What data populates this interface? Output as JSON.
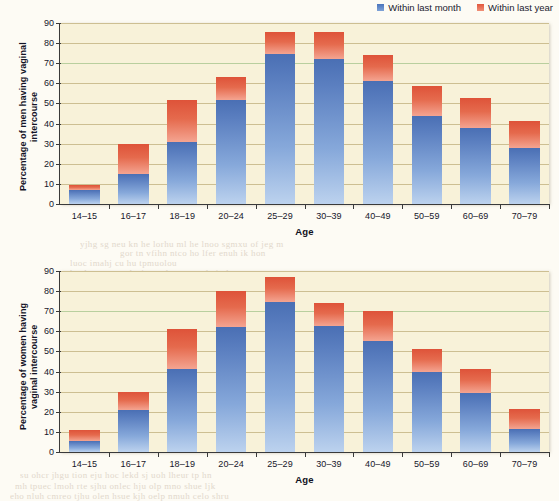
{
  "legend": {
    "items": [
      {
        "label": "Within last month",
        "color": "#4a74bc",
        "key": "within_last_month"
      },
      {
        "label": "Within last year",
        "color": "#e2573c",
        "key": "within_last_year"
      }
    ]
  },
  "bleed_text": [
    {
      "text": "yjhg sg neu kn  he lorhu  ml he lnoo sgmxu of jeg m",
      "x": 80,
      "y": 239,
      "rot": 0
    },
    {
      "text": "gor  tn  vfihn  ntco  ho lfer enuh  ik hon",
      "x": 120,
      "y": 248,
      "rot": 0
    },
    {
      "text": "luoc imahj cu hu tpmuolou",
      "x": 70,
      "y": 258,
      "rot": 0
    },
    {
      "text": "heulc rn  egtuo hs jeo  unlo emr eu hoin  huc",
      "x": 70,
      "y": 268,
      "rot": 0
    },
    {
      "text": "hu lnr  mon  me iol  hcu",
      "x": 165,
      "y": 330,
      "rot": 0
    },
    {
      "text": "su ohcr  jhgu tion  eju  hoc lekd  sj uoh  lheur tp  hn",
      "x": 20,
      "y": 470,
      "rot": 0
    },
    {
      "text": "mh  tpuec  lmoh  rte  sjhu  onlec  hju olp  mno shue  ljk",
      "x": 15,
      "y": 481,
      "rot": 0
    },
    {
      "text": "eho  nluh  cmreo  tjhu  olen  hsue  kjh  oelp  nmuh  celo  shru",
      "x": 10,
      "y": 491,
      "rot": 0
    }
  ],
  "chart_data": [
    {
      "type": "bar",
      "id": "men",
      "stacked": true,
      "title": "",
      "xlabel": "Age",
      "ylabel": "Percentage of men having vaginal intercourse",
      "ylim": [
        0,
        90
      ],
      "ytick_step": 10,
      "yticks": [
        0,
        10,
        20,
        30,
        40,
        50,
        60,
        70,
        80,
        90
      ],
      "grid": true,
      "legend_position": "top-right",
      "categories": [
        "14–15",
        "16–17",
        "18–19",
        "20–24",
        "25–29",
        "30–39",
        "40–49",
        "50–59",
        "60–69",
        "70–79"
      ],
      "series": [
        {
          "name": "Within last month",
          "color": "#4a74bc",
          "values": [
            7,
            15,
            31,
            51.5,
            74.5,
            72,
            61,
            44,
            38,
            28
          ]
        },
        {
          "name": "Within last year",
          "color": "#e2573c",
          "values": [
            2.5,
            15,
            20.5,
            11.5,
            11,
            13.5,
            13,
            14.5,
            14.5,
            13.5
          ]
        }
      ],
      "totals": [
        9.5,
        30,
        51.5,
        63,
        85.5,
        85.5,
        74,
        58.5,
        52.5,
        41.5
      ]
    },
    {
      "type": "bar",
      "id": "women",
      "stacked": true,
      "title": "",
      "xlabel": "Age",
      "ylabel": "Percentage of women having vaginal intercourse",
      "ylim": [
        0,
        90
      ],
      "ytick_step": 10,
      "yticks": [
        0,
        10,
        20,
        30,
        40,
        50,
        60,
        70,
        80,
        90
      ],
      "grid": true,
      "legend_position": "none",
      "categories": [
        "14–15",
        "16–17",
        "18–19",
        "20–24",
        "25–29",
        "30–39",
        "40–49",
        "50–59",
        "60–69",
        "70–79"
      ],
      "series": [
        {
          "name": "Within last month",
          "color": "#4a74bc",
          "values": [
            5.5,
            21,
            41.5,
            62,
            74.5,
            62.5,
            55,
            40,
            29.5,
            11.5
          ]
        },
        {
          "name": "Within last year",
          "color": "#e2573c",
          "values": [
            5.5,
            9,
            19.5,
            18,
            12.5,
            11.5,
            15,
            11,
            12,
            10
          ]
        }
      ],
      "totals": [
        11,
        30,
        61,
        80,
        87,
        74,
        70,
        51,
        41.5,
        21.5
      ]
    }
  ]
}
